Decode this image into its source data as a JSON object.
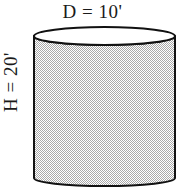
{
  "figure": {
    "name": "cylinder-dimension-diagram",
    "type": "geometry-diagram",
    "shape": "cylinder",
    "background_color": "#ffffff",
    "labels": {
      "diameter": "D = 10'",
      "height": "H = 20'"
    },
    "dimensions": {
      "diameter_value": 10,
      "height_value": 20,
      "unit": "feet",
      "unit_symbol": "'"
    },
    "style": {
      "outline_color": "#111111",
      "body_fill_gray": "#b0b0b0",
      "body_fill_white": "#ffffff",
      "top_face_fill": "#ffffff",
      "text_color": "#1a1a1a",
      "outline_width": 2,
      "fill_pattern": "50-percent-checkerboard-dither"
    },
    "geometry": {
      "left_x": 34,
      "right_x": 175,
      "top_ellipse_center_y": 36,
      "top_ellipse_ry": 9,
      "bottom_ellipse_center_y": 178,
      "bottom_ellipse_ry": 8,
      "body_top_y": 36,
      "body_bottom_y": 178
    }
  }
}
